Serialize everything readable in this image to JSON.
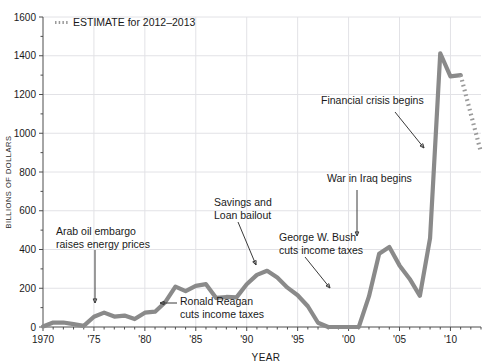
{
  "chart_data": {
    "type": "line",
    "title": "",
    "xlabel": "YEAR",
    "ylabel": "BILLIONS OF DOLLARS",
    "xlim": [
      1970,
      2013
    ],
    "ylim": [
      0,
      1600
    ],
    "grid": true,
    "legend_position": "top-left",
    "y_ticks": [
      0,
      200,
      400,
      600,
      800,
      1000,
      1200,
      1400,
      1600
    ],
    "y_tick_labels": [
      "0",
      "200",
      "400",
      "600",
      "800",
      "1000",
      "1200",
      "1400",
      "1600"
    ],
    "y_minor_step": 100,
    "x_ticks": [
      1970,
      1975,
      1980,
      1985,
      1990,
      1995,
      2000,
      2005,
      2010
    ],
    "x_tick_labels": [
      "1970",
      "'75",
      "'80",
      "'85",
      "'90",
      "'95",
      "'00",
      "'05",
      "'10"
    ],
    "x_minor_step": 1,
    "legend": [
      {
        "label": "ESTIMATE for 2012–2013",
        "style": "dotted",
        "color": "#9a9a9a"
      }
    ],
    "series": [
      {
        "name": "Federal budget deficit",
        "style": "solid",
        "color": "#8a8a8a",
        "x": [
          1970,
          1971,
          1972,
          1973,
          1974,
          1975,
          1976,
          1977,
          1978,
          1979,
          1980,
          1981,
          1982,
          1983,
          1984,
          1985,
          1986,
          1987,
          1988,
          1989,
          1990,
          1991,
          1992,
          1993,
          1994,
          1995,
          1996,
          1997,
          1998,
          1999,
          2000,
          2001,
          2002,
          2003,
          2004,
          2005,
          2006,
          2007,
          2008,
          2009,
          2010,
          2011
        ],
        "values": [
          3,
          23,
          23,
          15,
          6,
          53,
          74,
          54,
          59,
          41,
          74,
          79,
          128,
          208,
          185,
          212,
          221,
          150,
          155,
          153,
          221,
          269,
          290,
          255,
          203,
          164,
          107,
          22,
          0,
          0,
          0,
          0,
          158,
          378,
          413,
          318,
          248,
          161,
          459,
          1413,
          1294,
          1300
        ],
        "estimate_x": [
          2011,
          2012,
          2013
        ],
        "estimate_values": [
          1300,
          1100,
          901
        ]
      }
    ],
    "annotations": [
      {
        "text_lines": [
          "Arab oil embargo",
          "raises energy prices"
        ],
        "x": 1974,
        "y": 74
      },
      {
        "text_lines": [
          "Ronald Reagan",
          "cuts income taxes"
        ],
        "x": 1981,
        "y": 79
      },
      {
        "text_lines": [
          "Savings and",
          "Loan bailout"
        ],
        "x": 1992,
        "y": 290
      },
      {
        "text_lines": [
          "George W. Bush",
          "cuts income taxes"
        ],
        "x": 2002,
        "y": 158
      },
      {
        "text_lines": [
          "War in Iraq begins"
        ],
        "x": 2003,
        "y": 378
      },
      {
        "text_lines": [
          "Financial crisis begins"
        ],
        "x": 2008,
        "y": 459
      }
    ]
  }
}
